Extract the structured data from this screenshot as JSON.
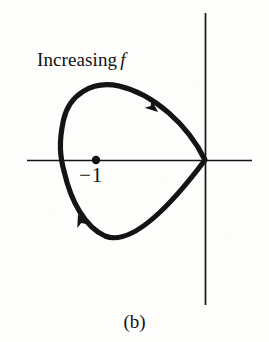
{
  "figure": {
    "caption": "(b)",
    "background_color": "#fdfdfc",
    "ink_color": "#121212"
  },
  "labels": {
    "increasing_text": "Increasing",
    "increasing_symbol": "f",
    "point_label": "−1"
  },
  "axes": {
    "x_axis": {
      "x1": 27,
      "y1": 160,
      "x2": 252,
      "y2": 160
    },
    "y_axis": {
      "x1": 205,
      "y1": 13,
      "x2": 205,
      "y2": 305
    },
    "origin": {
      "x": 205,
      "y": 160
    },
    "stroke_width": 1.6
  },
  "chart_data": {
    "type": "line",
    "title": "(b)",
    "xlabel": "",
    "ylabel": "",
    "grid": false,
    "legend": null,
    "annotations": [
      {
        "text": "Increasing f",
        "x": 37,
        "y": 50
      },
      {
        "text": "−1",
        "x": 79,
        "y": 165
      }
    ],
    "marked_points": [
      {
        "label": "−1",
        "x": 96,
        "y": 160,
        "radius": 4.2
      }
    ],
    "cusp_point": {
      "x": 205,
      "y": 160
    },
    "direction_arrows": [
      {
        "name": "upper-branch-arrow",
        "x": 155,
        "y": 110,
        "angle_deg": 38
      },
      {
        "name": "lower-branch-arrow",
        "x": 80,
        "y": 219,
        "angle_deg": 249
      }
    ],
    "curve_path": "M 205 160 C 186 126 152 94 118 86 C 92 80 70 96 64 120 C 58 144 60 156 64 172 C 70 200 84 226 104 236 C 130 249 170 205 205 160 Z",
    "curve_stroke_width": 5.2
  },
  "interaction": {
    "increasing_label_name": "increasing-f-annotation",
    "point_label_name": "minus-one-annotation",
    "caption_name": "figure-caption"
  }
}
